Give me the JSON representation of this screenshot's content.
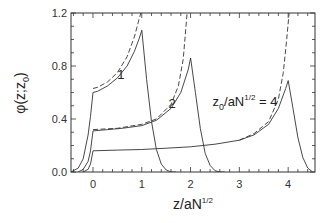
{
  "chart_data": {
    "type": "line",
    "title": "",
    "xlabel": "z/aN^{1/2}",
    "xlabel_main": "z/aN",
    "xlabel_sup": "1/2",
    "ylabel": "φ(z;z0)",
    "ylabel_main": "φ(z;z",
    "ylabel_sub": "0",
    "ylabel_close": ")",
    "xlim": [
      -0.45,
      4.55
    ],
    "ylim": [
      0.0,
      1.2
    ],
    "xticks": [
      0,
      1,
      2,
      3,
      4
    ],
    "xtick_labels": [
      "0",
      "1",
      "2",
      "3",
      "4"
    ],
    "yticks": [
      0.0,
      0.4,
      0.8,
      1.2
    ],
    "ytick_labels": [
      "0.0",
      "0.4",
      "0.8",
      "1.2"
    ],
    "grid": false,
    "legend": "none",
    "annotations": [
      {
        "text": "1",
        "x": 0.5,
        "y": 0.7
      },
      {
        "text": "2",
        "x": 1.55,
        "y": 0.48
      },
      {
        "text_main": "z",
        "text_sub": "0",
        "text_mid": "/aN",
        "text_sup": "1/2",
        "text_end": " = 4",
        "x": 2.45,
        "y": 0.5
      }
    ],
    "series": [
      {
        "name": "z0/aN^1/2 = 1 (solid)",
        "style": "solid",
        "x": [
          -0.45,
          -0.3,
          -0.2,
          -0.1,
          -0.05,
          0.0,
          0.1,
          0.3,
          0.5,
          0.7,
          0.85,
          0.95,
          1.0,
          1.1,
          1.2,
          1.3,
          1.4,
          1.5,
          1.6,
          1.7
        ],
        "y": [
          0.0,
          0.03,
          0.1,
          0.28,
          0.42,
          0.6,
          0.61,
          0.65,
          0.71,
          0.8,
          0.91,
          1.01,
          1.07,
          0.7,
          0.38,
          0.17,
          0.06,
          0.015,
          0.0,
          0.0
        ]
      },
      {
        "name": "z0/aN^1/2 = 1 (dashed)",
        "style": "dashed",
        "x": [
          0.0,
          0.1,
          0.3,
          0.5,
          0.7,
          0.85,
          0.93,
          0.98
        ],
        "y": [
          0.63,
          0.64,
          0.68,
          0.75,
          0.87,
          1.02,
          1.13,
          1.2
        ]
      },
      {
        "name": "z0/aN^1/2 = 2 (solid)",
        "style": "solid",
        "x": [
          -0.3,
          -0.2,
          -0.1,
          -0.05,
          0.0,
          0.3,
          0.6,
          1.0,
          1.3,
          1.6,
          1.8,
          1.95,
          2.0,
          2.1,
          2.2,
          2.3,
          2.4,
          2.5,
          2.6,
          2.7
        ],
        "y": [
          0.0,
          0.02,
          0.08,
          0.16,
          0.31,
          0.32,
          0.33,
          0.35,
          0.39,
          0.48,
          0.6,
          0.77,
          0.86,
          0.6,
          0.33,
          0.14,
          0.05,
          0.01,
          0.0,
          0.0
        ]
      },
      {
        "name": "z0/aN^1/2 = 2 (dashed)",
        "style": "dashed",
        "x": [
          0.0,
          0.5,
          1.0,
          1.3,
          1.6,
          1.75,
          1.85,
          1.93
        ],
        "y": [
          0.32,
          0.33,
          0.36,
          0.4,
          0.51,
          0.65,
          0.85,
          1.2
        ]
      },
      {
        "name": "z0/aN^1/2 = 4 (solid)",
        "style": "solid",
        "x": [
          -0.2,
          -0.1,
          -0.05,
          0.0,
          0.5,
          1.0,
          1.5,
          2.0,
          2.5,
          3.0,
          3.3,
          3.6,
          3.8,
          3.95,
          4.0,
          4.1,
          4.2,
          4.3,
          4.4,
          4.5
        ],
        "y": [
          0.0,
          0.02,
          0.06,
          0.16,
          0.165,
          0.17,
          0.18,
          0.19,
          0.21,
          0.24,
          0.28,
          0.36,
          0.48,
          0.63,
          0.69,
          0.48,
          0.26,
          0.11,
          0.03,
          0.0
        ]
      },
      {
        "name": "z0/aN^1/2 = 4 (dashed)",
        "style": "dashed",
        "x": [
          3.0,
          3.3,
          3.6,
          3.8,
          3.9,
          3.97,
          4.02
        ],
        "y": [
          0.24,
          0.29,
          0.38,
          0.55,
          0.75,
          1.0,
          1.2
        ]
      }
    ]
  }
}
